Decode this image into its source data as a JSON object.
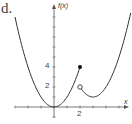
{
  "part_label": "d.",
  "chart_data": {
    "type": "line",
    "title": "",
    "xlabel": "x",
    "ylabel": "f(x)",
    "x_tick_labels": [
      {
        "value": 2,
        "label": "2"
      }
    ],
    "y_tick_labels": [
      {
        "value": 2,
        "label": "2"
      },
      {
        "value": 4,
        "label": "4"
      }
    ],
    "xlim": [
      -3,
      6
    ],
    "ylim": [
      -1,
      10
    ],
    "grid": false,
    "series": [
      {
        "name": "left piece",
        "formula": "x^2",
        "domain": [
          -3,
          2
        ],
        "points": [
          [
            -3,
            9
          ],
          [
            -2,
            4
          ],
          [
            -1,
            1
          ],
          [
            0,
            0
          ],
          [
            1,
            1
          ],
          [
            2,
            4
          ]
        ],
        "endpoint": {
          "x": 2,
          "y": 4,
          "style": "closed"
        }
      },
      {
        "name": "right piece",
        "formula": "(x-3)^2 + 1",
        "domain": [
          2,
          5.9
        ],
        "points": [
          [
            2,
            2
          ],
          [
            3,
            1
          ],
          [
            4,
            2
          ],
          [
            5,
            5
          ],
          [
            5.9,
            9.4
          ]
        ],
        "endpoint": {
          "x": 2,
          "y": 2,
          "style": "open"
        }
      }
    ]
  },
  "labels": {
    "y_axis": "f(x)",
    "x_axis": "x",
    "x_tick_2": "2",
    "y_tick_2": "2",
    "y_tick_4": "4"
  }
}
